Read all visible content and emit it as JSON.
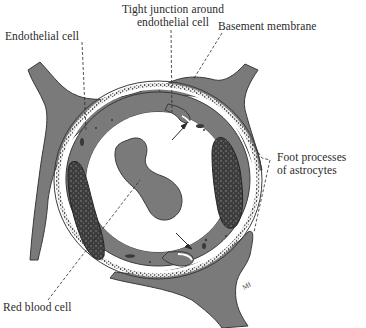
{
  "diagram": {
    "colors": {
      "background": "#ffffff",
      "tissue_fill": "#7a7a7a",
      "outline": "#3a3a3a",
      "membrane": "#f2f2f2",
      "nucleus": "#3c3c3c",
      "lumen": "#ffffff",
      "text": "#2a2a2a"
    },
    "labels": {
      "tight_junction_line1": "Tight junction around",
      "tight_junction_line2": "endothelial cell",
      "endothelial_cell": "Endothelial cell",
      "basement_membrane": "Basement membrane",
      "foot_processes_line1": "Foot processes",
      "foot_processes_line2": "of astrocytes",
      "red_blood_cell": "Red blood cell",
      "signature": "Mf"
    },
    "structures": [
      "endothelial-cell-ring",
      "tight-junction-top",
      "tight-junction-bottom",
      "basement-membrane",
      "astrocyte-foot-process-upper-left",
      "astrocyte-foot-process-upper-right",
      "astrocyte-foot-process-lower-right",
      "nucleus-left",
      "nucleus-right",
      "red-blood-cell",
      "lumen"
    ]
  }
}
